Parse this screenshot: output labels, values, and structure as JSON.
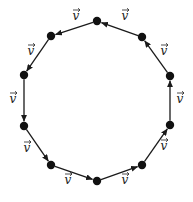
{
  "diagram": {
    "type": "directed-cycle",
    "shape": "decagon",
    "colors": {
      "edge": "#1a1a1a",
      "vertex": "#111111",
      "label": "#222222",
      "background": "#ffffff"
    },
    "edge_label": "v",
    "vertices": [
      {
        "id": 0,
        "x": 97,
        "y": 181
      },
      {
        "id": 1,
        "x": 142,
        "y": 165
      },
      {
        "id": 2,
        "x": 170,
        "y": 125
      },
      {
        "id": 3,
        "x": 170,
        "y": 76
      },
      {
        "id": 4,
        "x": 142,
        "y": 37
      },
      {
        "id": 5,
        "x": 97,
        "y": 21
      },
      {
        "id": 6,
        "x": 51,
        "y": 36
      },
      {
        "id": 7,
        "x": 24,
        "y": 75
      },
      {
        "id": 8,
        "x": 24,
        "y": 126
      },
      {
        "id": 9,
        "x": 51,
        "y": 165
      }
    ],
    "edges": [
      {
        "from": 0,
        "to": 1,
        "label": "v",
        "lx": 125,
        "ly": 184
      },
      {
        "from": 1,
        "to": 2,
        "label": "v",
        "lx": 164,
        "ly": 150
      },
      {
        "from": 2,
        "to": 3,
        "label": "v",
        "lx": 180,
        "ly": 103
      },
      {
        "from": 3,
        "to": 4,
        "label": "v",
        "lx": 164,
        "ly": 55
      },
      {
        "from": 4,
        "to": 5,
        "label": "v",
        "lx": 125,
        "ly": 20
      },
      {
        "from": 5,
        "to": 6,
        "label": "v",
        "lx": 76,
        "ly": 20
      },
      {
        "from": 6,
        "to": 7,
        "label": "v",
        "lx": 31,
        "ly": 55
      },
      {
        "from": 7,
        "to": 8,
        "label": "v",
        "lx": 13,
        "ly": 103
      },
      {
        "from": 8,
        "to": 9,
        "label": "v",
        "lx": 27,
        "ly": 152
      },
      {
        "from": 9,
        "to": 0,
        "label": "v",
        "lx": 68,
        "ly": 184
      }
    ]
  }
}
